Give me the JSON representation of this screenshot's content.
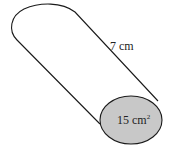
{
  "diagram": {
    "type": "cylinder",
    "labels": {
      "length": "7 cm",
      "base_area": "15 cm",
      "base_area_exponent": "2"
    },
    "colors": {
      "outline": "#1a1a1a",
      "base_fill": "#c8c8c8",
      "background": "#ffffff"
    }
  }
}
